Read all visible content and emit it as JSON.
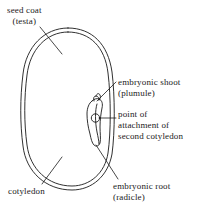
{
  "figure": {
    "kind": "botanical-line-diagram",
    "line_color": "#1a1a1a",
    "background_color": "#ffffff",
    "text_color": "#1a1a1a"
  },
  "labels": {
    "seed_coat": {
      "line1": "seed coat",
      "line2": "(testa)"
    },
    "embryonic_shoot": {
      "line1": "embryonic shoot",
      "line2": "(plumule)"
    },
    "point_of_attachment": {
      "line1": "point of",
      "line2": "attachment of",
      "line3": "second cotyledon"
    },
    "cotyledon": {
      "line1": "cotyledon"
    },
    "embryonic_root": {
      "line1": "embryonic root",
      "line2": "(radicle)"
    }
  }
}
